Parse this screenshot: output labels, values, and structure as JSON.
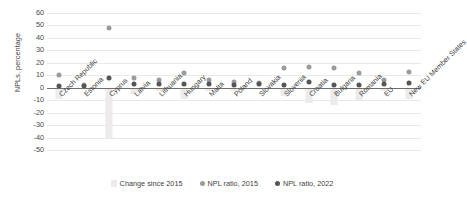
{
  "chart_data": {
    "type": "bar",
    "title": "",
    "xlabel": "",
    "ylabel": "NPLs, percentage",
    "ylim": [
      -50,
      60
    ],
    "yticks": [
      60,
      50,
      40,
      30,
      20,
      10,
      0,
      -10,
      -20,
      -30,
      -40,
      -50
    ],
    "grid": true,
    "legend_position": "bottom",
    "categories": [
      "Czech Republic",
      "Estonia",
      "Cyprus",
      "Latvia",
      "Lithuania",
      "Hungary",
      "Malta",
      "Poland",
      "Slovakia",
      "Slovenia",
      "Croatia",
      "Bulgaria",
      "Romania",
      "EU",
      "New EU Member States"
    ],
    "series": [
      {
        "name": "Change since 2015",
        "type": "bar",
        "color": "#eceaea",
        "values": [
          -9,
          -1,
          -40,
          -5,
          -3,
          -9,
          -3,
          -3,
          -1,
          -7,
          -12,
          -14,
          -10,
          -3,
          -9
        ]
      },
      {
        "name": "NPL ratio, 2015",
        "type": "scatter",
        "color": "#9b9b9b",
        "values": [
          10,
          2,
          48,
          8,
          6,
          12,
          6,
          5,
          4,
          16,
          17,
          16,
          12,
          6,
          13
        ]
      },
      {
        "name": "NPL ratio, 2022",
        "type": "scatter",
        "color": "#555555",
        "values": [
          1,
          1,
          8,
          3,
          3,
          3,
          3,
          2,
          3,
          2,
          5,
          2,
          2,
          3,
          4
        ]
      }
    ]
  },
  "legend": {
    "items": [
      {
        "label": "Change since 2015",
        "marker": "bar-swatch"
      },
      {
        "label": "NPL ratio, 2015",
        "marker": "circle-gray"
      },
      {
        "label": "NPL ratio, 2022",
        "marker": "circle-dark"
      }
    ]
  }
}
